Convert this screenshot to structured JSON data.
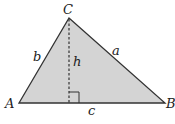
{
  "figure": {
    "type": "triangle-with-altitude",
    "fill_color": "#d4d4d4",
    "stroke_color": "#333333",
    "vertices": {
      "A": {
        "label": "A",
        "x": 19,
        "y": 103
      },
      "B": {
        "label": "B",
        "x": 165,
        "y": 103
      },
      "C": {
        "label": "C",
        "x": 69,
        "y": 18
      }
    },
    "sides": {
      "a": {
        "label": "a"
      },
      "b": {
        "label": "b"
      },
      "c": {
        "label": "c"
      }
    },
    "altitude": {
      "label": "h",
      "style": "dashed",
      "right_angle_marker": true
    }
  }
}
